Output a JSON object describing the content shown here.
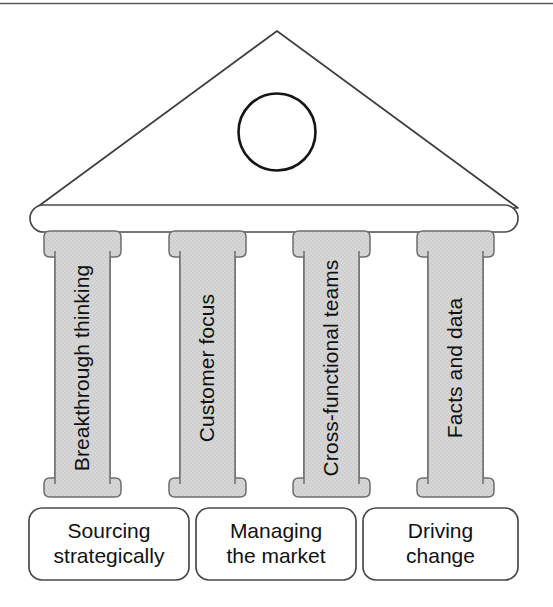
{
  "diagram": {
    "type": "temple-diagram",
    "title": "",
    "top_rule": true,
    "roof": {
      "name": "pediment",
      "shape": "triangle",
      "fill": "#ffffff",
      "stroke": "#3c3c3c"
    },
    "emblem": {
      "name": "circle-emblem",
      "shape": "circle",
      "fill": "#ffffff",
      "stroke": "#1a1a1a"
    },
    "entablature": {
      "name": "entablature-bar",
      "fill": "#ffffff",
      "stroke": "#4a4a4a"
    },
    "pillars": [
      {
        "label": "Breakthrough thinking",
        "fill": "#d4d4d4",
        "stroke": "#6e6e6e"
      },
      {
        "label": "Customer focus",
        "fill": "#d4d4d4",
        "stroke": "#6e6e6e"
      },
      {
        "label": "Cross-functional teams",
        "fill": "#d4d4d4",
        "stroke": "#6e6e6e"
      },
      {
        "label": "Facts and data",
        "fill": "#d4d4d4",
        "stroke": "#6e6e6e"
      }
    ],
    "base_boxes": [
      {
        "lines": [
          "Sourcing",
          "strategically"
        ],
        "fill": "#ffffff",
        "stroke": "#4a4a4a"
      },
      {
        "lines": [
          "Managing",
          "the market"
        ],
        "fill": "#ffffff",
        "stroke": "#4a4a4a"
      },
      {
        "lines": [
          "Driving",
          "change"
        ],
        "fill": "#ffffff",
        "stroke": "#4a4a4a"
      }
    ]
  }
}
